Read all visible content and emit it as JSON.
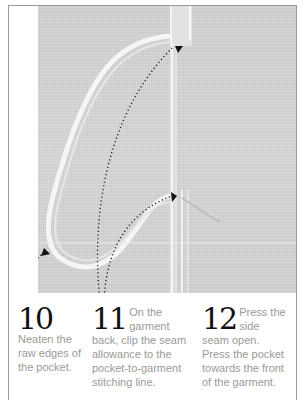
{
  "figure": {
    "image_description": "Photo of garment side seam with in-seam pocket, dotted arrows pointing to pocket edges and seam clip points",
    "colors": {
      "frame_border": "#9a9a9a",
      "fabric": "#d4d4d4",
      "step_number": "#111111",
      "step_text": "#9a9a9a"
    }
  },
  "steps": [
    {
      "number": "10",
      "text": "Neaten the raw edges of the pocket."
    },
    {
      "number": "11",
      "text": "On the garment back, clip the seam allowance to the pocket-to-garment stitching line."
    },
    {
      "number": "12",
      "text": "Press the side seam open. Press the pocket towards the front of the garment."
    }
  ]
}
